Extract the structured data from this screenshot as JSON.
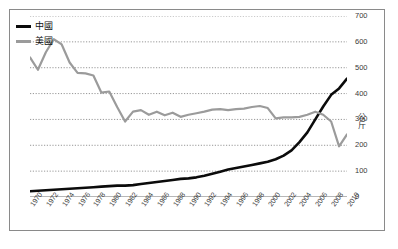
{
  "chart_data": {
    "type": "line",
    "title": "",
    "subtitle": "",
    "xlabel": "",
    "ylabel": "公斤",
    "ylim": [
      0,
      700
    ],
    "xlim": [
      1970,
      2010
    ],
    "ytick_step": 100,
    "grid": true,
    "grid_style": "dotted-horizontal",
    "legend_position": "top-left",
    "ytick_labels": [
      "0",
      "100",
      "200",
      "300",
      "400",
      "500",
      "600",
      "700"
    ],
    "ytick_values": [
      0,
      100,
      200,
      300,
      400,
      500,
      600,
      700
    ],
    "xtick_labels": [
      "1970",
      "1972",
      "1974",
      "1976",
      "1978",
      "1980",
      "1982",
      "1984",
      "1986",
      "1988",
      "1990",
      "1992",
      "1994",
      "1996",
      "1998",
      "2000",
      "2002",
      "2004",
      "2006",
      "2008",
      "2010"
    ],
    "x": [
      1970,
      1971,
      1972,
      1973,
      1974,
      1975,
      1976,
      1977,
      1978,
      1979,
      1980,
      1981,
      1982,
      1983,
      1984,
      1985,
      1986,
      1987,
      1988,
      1989,
      1990,
      1991,
      1992,
      1993,
      1994,
      1995,
      1996,
      1997,
      1998,
      1999,
      2000,
      2001,
      2002,
      2003,
      2004,
      2005,
      2006,
      2007,
      2008,
      2009,
      2010
    ],
    "series": [
      {
        "name": "中國",
        "color": "#0b0b0b",
        "width": 2.6,
        "values": [
          22,
          24,
          26,
          28,
          30,
          32,
          34,
          36,
          38,
          40,
          42,
          44,
          44,
          46,
          50,
          54,
          58,
          62,
          66,
          70,
          72,
          76,
          82,
          90,
          98,
          106,
          112,
          118,
          124,
          130,
          136,
          146,
          160,
          180,
          212,
          250,
          300,
          350,
          395,
          420,
          458
        ]
      },
      {
        "name": "美國",
        "color": "#9b9b9b",
        "width": 2.2,
        "values": [
          540,
          492,
          560,
          610,
          590,
          520,
          480,
          478,
          470,
          404,
          408,
          348,
          292,
          330,
          336,
          318,
          330,
          316,
          326,
          310,
          318,
          324,
          330,
          338,
          340,
          336,
          340,
          342,
          348,
          352,
          344,
          304,
          308,
          308,
          310,
          318,
          330,
          318,
          292,
          196,
          242
        ]
      }
    ]
  },
  "legend": {
    "items": [
      {
        "label": "中國",
        "color": "#0b0b0b"
      },
      {
        "label": "美國",
        "color": "#9b9b9b"
      }
    ]
  },
  "axis": {
    "y_title": "公斤"
  }
}
